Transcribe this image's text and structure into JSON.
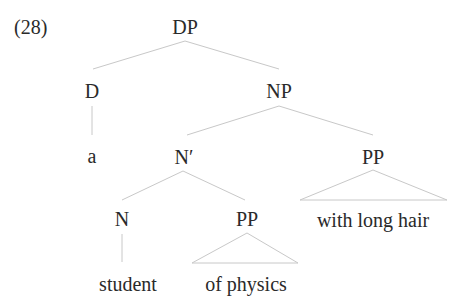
{
  "example_number": "(28)",
  "tree": {
    "root": "DP",
    "nodes": {
      "dp": "DP",
      "d": "D",
      "np": "NP",
      "a": "a",
      "n_bar": "N′",
      "pp_adjunct": "PP",
      "n": "N",
      "pp_complement": "PP",
      "student": "student",
      "of_physics": "of physics",
      "with_long_hair": "with long hair"
    },
    "structure": "[DP [D a] [NP [N' [N student] [PP of physics]] [PP with long hair]]]"
  }
}
